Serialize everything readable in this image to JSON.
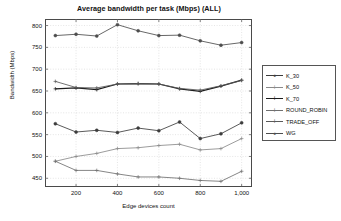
{
  "chart_data": {
    "type": "line",
    "title": "Average bandwidth per task (Mbps) (ALL)",
    "xlabel": "Edge devices count",
    "ylabel": "Bandwidth (Mbps)",
    "x": [
      100,
      200,
      300,
      400,
      500,
      600,
      700,
      800,
      900,
      1000
    ],
    "xlim": [
      50,
      1050
    ],
    "ylim": [
      430,
      815
    ],
    "xticks": [
      200,
      400,
      600,
      800,
      1000
    ],
    "xtick_labels": [
      "200",
      "400",
      "600",
      "800",
      "1,000"
    ],
    "yticks": [
      450,
      500,
      550,
      600,
      650,
      700,
      750,
      800
    ],
    "ytick_labels": [
      "450",
      "500",
      "550",
      "600",
      "650",
      "700",
      "750",
      "800"
    ],
    "grid": true,
    "legend_position": "right-outside",
    "series": [
      {
        "name": "K_30",
        "color": "#3c3c3c",
        "marker": "dot",
        "values": [
          575,
          556,
          560,
          555,
          565,
          559,
          579,
          541,
          552,
          577
        ]
      },
      {
        "name": "K_50",
        "color": "#8a8a8a",
        "marker": "plus",
        "values": [
          489,
          500,
          507,
          518,
          520,
          525,
          528,
          515,
          518,
          541
        ]
      },
      {
        "name": "K_70",
        "color": "#1c1c1c",
        "marker": "plus",
        "values": [
          655,
          657,
          653,
          666,
          667,
          666,
          655,
          649,
          661,
          675
        ]
      },
      {
        "name": "ROUND_ROBIN",
        "color": "#707070",
        "marker": "plus",
        "values": [
          489,
          468,
          468,
          460,
          453,
          453,
          450,
          445,
          443,
          466
        ]
      },
      {
        "name": "TRADE_OFF",
        "color": "#5a5a5a",
        "marker": "plus",
        "values": [
          672,
          658,
          657,
          666,
          667,
          666,
          656,
          652,
          662,
          674
        ]
      },
      {
        "name": "WG",
        "color": "#4d4d4d",
        "marker": "dot",
        "values": [
          777,
          780,
          776,
          802,
          788,
          777,
          778,
          765,
          755,
          761
        ]
      }
    ]
  }
}
